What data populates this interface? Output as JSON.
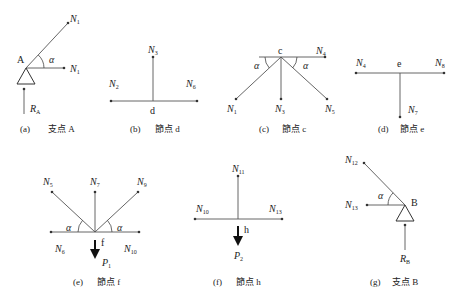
{
  "figures": [
    {
      "id": "a",
      "caption_tag": "(a)",
      "caption_text": "支点 A",
      "node": "A",
      "angle": "α",
      "forces": [
        {
          "name": "N",
          "sub": "1",
          "direction": "diagonal-up-right"
        },
        {
          "name": "N",
          "sub": "1",
          "direction": "right"
        },
        {
          "name": "R",
          "sub": "A",
          "direction": "up",
          "type": "reaction"
        }
      ]
    },
    {
      "id": "b",
      "caption_tag": "(b)",
      "caption_text": "節点 d",
      "node": "d",
      "forces": [
        {
          "name": "N",
          "sub": "3",
          "direction": "up"
        },
        {
          "name": "N",
          "sub": "2",
          "direction": "left"
        },
        {
          "name": "N",
          "sub": "6",
          "direction": "right"
        }
      ]
    },
    {
      "id": "c",
      "caption_tag": "(c)",
      "caption_text": "節点 c",
      "node": "c",
      "angle": "α",
      "forces": [
        {
          "name": "N",
          "sub": "4",
          "direction": "right"
        },
        {
          "name": "N",
          "sub": "1",
          "direction": "down-left"
        },
        {
          "name": "N",
          "sub": "3",
          "direction": "down"
        },
        {
          "name": "N",
          "sub": "5",
          "direction": "down-right"
        }
      ]
    },
    {
      "id": "d",
      "caption_tag": "(d)",
      "caption_text": "節点 e",
      "node": "e",
      "forces": [
        {
          "name": "N",
          "sub": "4",
          "direction": "left"
        },
        {
          "name": "N",
          "sub": "8",
          "direction": "right"
        },
        {
          "name": "N",
          "sub": "7",
          "direction": "down"
        }
      ]
    },
    {
      "id": "e",
      "caption_tag": "(e)",
      "caption_text": "節点 f",
      "node": "f",
      "angle": "α",
      "forces": [
        {
          "name": "N",
          "sub": "5",
          "direction": "up-left"
        },
        {
          "name": "N",
          "sub": "7",
          "direction": "up"
        },
        {
          "name": "N",
          "sub": "9",
          "direction": "up-right"
        },
        {
          "name": "N",
          "sub": "6",
          "direction": "left"
        },
        {
          "name": "N",
          "sub": "10",
          "direction": "right"
        },
        {
          "name": "P",
          "sub": "1",
          "direction": "down",
          "type": "load"
        }
      ]
    },
    {
      "id": "f",
      "caption_tag": "(f)",
      "caption_text": "節点 h",
      "node": "h",
      "forces": [
        {
          "name": "N",
          "sub": "11",
          "direction": "up"
        },
        {
          "name": "N",
          "sub": "10",
          "direction": "left"
        },
        {
          "name": "N",
          "sub": "13",
          "direction": "right"
        },
        {
          "name": "P",
          "sub": "2",
          "direction": "down",
          "type": "load"
        }
      ]
    },
    {
      "id": "g",
      "caption_tag": "(g)",
      "caption_text": "支点 B",
      "node": "B",
      "angle": "α",
      "forces": [
        {
          "name": "N",
          "sub": "12",
          "direction": "up-left"
        },
        {
          "name": "N",
          "sub": "13",
          "direction": "left"
        },
        {
          "name": "R",
          "sub": "B",
          "direction": "up",
          "type": "reaction"
        }
      ]
    }
  ]
}
